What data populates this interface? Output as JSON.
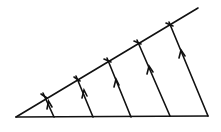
{
  "diagram": {
    "stroke_color": "#111111",
    "background": "#ffffff",
    "apex": [
      16,
      117
    ],
    "base_end": [
      208,
      116
    ],
    "upper_end": [
      198,
      8
    ],
    "arrow_lines": [
      {
        "from": [
          54,
          117
        ],
        "to": [
          44,
          96
        ]
      },
      {
        "from": [
          93,
          117
        ],
        "to": [
          77,
          78
        ]
      },
      {
        "from": [
          131,
          117
        ],
        "to": [
          108,
          60
        ]
      },
      {
        "from": [
          170,
          116
        ],
        "to": [
          138,
          42
        ]
      },
      {
        "from": [
          208,
          116
        ],
        "to": [
          170,
          24
        ]
      }
    ]
  }
}
